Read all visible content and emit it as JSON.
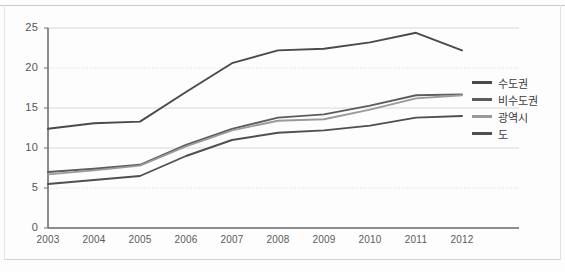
{
  "chart_data": {
    "type": "line",
    "title": "",
    "xlabel": "",
    "ylabel": "",
    "categories": [
      "2003",
      "2004",
      "2005",
      "2006",
      "2007",
      "2008",
      "2009",
      "2010",
      "2011",
      "2012"
    ],
    "x": [
      2003,
      2004,
      2005,
      2006,
      2007,
      2008,
      2009,
      2010,
      2011,
      2012
    ],
    "ylim": [
      0,
      25
    ],
    "xlim": [
      2003,
      2012
    ],
    "yticks": [
      0,
      5,
      10,
      15,
      20,
      25
    ],
    "grid": true,
    "legend_position": "right",
    "series": [
      {
        "name": "수도권",
        "color": "#4a4a4a",
        "values": [
          12.4,
          13.1,
          13.3,
          17.0,
          20.6,
          22.2,
          22.4,
          23.2,
          24.4,
          22.2
        ]
      },
      {
        "name": "비수도권",
        "color": "#5c5c5c",
        "values": [
          7.0,
          7.4,
          7.9,
          10.4,
          12.4,
          13.8,
          14.2,
          15.3,
          16.6,
          16.7
        ]
      },
      {
        "name": "광역시",
        "color": "#9a9a9a",
        "values": [
          6.7,
          7.2,
          7.8,
          10.2,
          12.2,
          13.4,
          13.6,
          14.8,
          16.2,
          16.6
        ]
      },
      {
        "name": "도",
        "color": "#4f4f4f",
        "values": [
          5.5,
          6.0,
          6.5,
          9.0,
          11.0,
          11.9,
          12.2,
          12.8,
          13.8,
          14.0
        ]
      }
    ]
  },
  "legend": {
    "items": [
      {
        "label": "수도권"
      },
      {
        "label": "비수도권"
      },
      {
        "label": "광역시"
      },
      {
        "label": "도"
      }
    ]
  },
  "axis": {
    "y_tick_labels": [
      "25",
      "20",
      "15",
      "10",
      "5",
      "0"
    ],
    "x_tick_labels": [
      "2003",
      "2004",
      "2005",
      "2006",
      "2007",
      "2008",
      "2009",
      "2010",
      "2011",
      "2012"
    ]
  },
  "colors": {
    "gridline": "#d8d8d8",
    "axis": "#6e6e6e",
    "background": "#fdfdfd",
    "tick_text": "#555555"
  }
}
